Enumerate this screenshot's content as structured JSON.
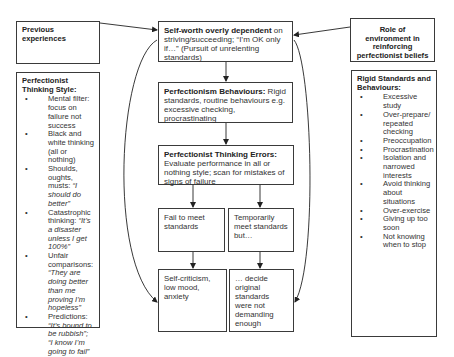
{
  "diagram": {
    "left": {
      "previous_experiences": "Previous experiences",
      "thinking_style": {
        "title": "Perfectionist Thinking Style:",
        "items": [
          {
            "text": "Mental filter: focus on failure not success",
            "quote": ""
          },
          {
            "text": "Black and white thinking (all or nothing)",
            "quote": ""
          },
          {
            "text": "Shoulds, oughts, musts: ",
            "quote": "“I should do better”"
          },
          {
            "text": "Catastrophic thinking: ",
            "quote": "“It’s a disaster unless I get 100%”"
          },
          {
            "text": "Unfair comparisons: ",
            "quote": "“They are doing better than me proving I’m hopeless”"
          },
          {
            "text": "Predictions: ",
            "quote": "“It’s bound to be rubbish”; “I know I’m going to fail”"
          }
        ]
      }
    },
    "center": {
      "self_worth": {
        "bold": "Self-worth overly dependent",
        "text": " on striving/succeeding; “I’m OK only if…” (Pursuit of unrelenting standards)"
      },
      "behaviours": {
        "bold": "Perfectionism Behaviours:",
        "text": " Rigid standards, routine behaviours e.g. excessive checking, procrastinating"
      },
      "thinking_errors": {
        "bold": "Perfectionist Thinking Errors:",
        "text": " Evaluate performance in all or nothing style; scan for mistakes of signs of failure"
      },
      "fail": "Fail to meet standards",
      "temp_meet": "Temporarily meet standards but…",
      "self_criticism": "Self-criticism, low mood, anxiety",
      "decide": "… decide original standards were not demanding enough"
    },
    "right": {
      "environment": "Role of environment in reinforcing perfectionist beliefs",
      "rigid": {
        "title": "Rigid Standards and Behaviours:",
        "items": [
          "Excessive study",
          "Over-prepare/ repeated checking",
          "Preoccupation",
          "Procrastination",
          "Isolation and narrowed interests",
          "Avoid thinking about situations",
          "Over-exercise",
          "Giving up too soon",
          "Not knowing when to stop"
        ]
      }
    },
    "bullet": "•",
    "colors": {
      "border": "#3a3a3a",
      "text": "#333333",
      "arrow": "#222222"
    }
  }
}
